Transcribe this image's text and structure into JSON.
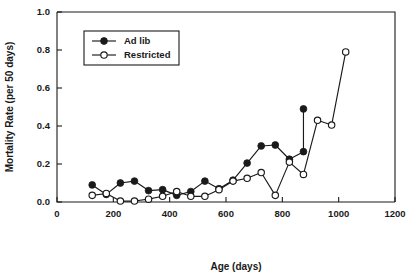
{
  "chart_data": {
    "type": "line",
    "title": "",
    "xlabel": "Age (days)",
    "ylabel": "Mortality Rate (per 50 days)",
    "xlim": [
      0,
      1200
    ],
    "ylim": [
      0.0,
      1.0
    ],
    "xticks": [
      0,
      200,
      400,
      600,
      800,
      1000,
      1200
    ],
    "xtick_labels": [
      "0",
      "200",
      "400",
      "600",
      "800",
      "1000",
      "1200"
    ],
    "yticks": [
      0.0,
      0.2,
      0.4,
      0.6,
      0.8,
      1.0
    ],
    "ytick_labels": [
      "0.0",
      "0.2",
      "0.4",
      "0.6",
      "0.8",
      "1.0"
    ],
    "grid": false,
    "legend_position": "upper-left-inset",
    "series": [
      {
        "name": "Ad lib",
        "marker": "filled-circle",
        "color": "#1a1a1a",
        "x": [
          125,
          175,
          225,
          275,
          325,
          375,
          425,
          475,
          525,
          575,
          625,
          675,
          725,
          775,
          825,
          875,
          875
        ],
        "y": [
          0.09,
          0.04,
          0.1,
          0.11,
          0.06,
          0.065,
          0.035,
          0.055,
          0.11,
          0.07,
          0.115,
          0.205,
          0.295,
          0.3,
          0.225,
          0.265,
          0.49
        ]
      },
      {
        "name": "Restricted",
        "marker": "open-circle",
        "color": "#1a1a1a",
        "x": [
          125,
          175,
          225,
          275,
          325,
          375,
          425,
          475,
          525,
          575,
          625,
          675,
          725,
          775,
          825,
          875,
          925,
          975,
          1025
        ],
        "y": [
          0.035,
          0.045,
          0.005,
          0.005,
          0.015,
          0.03,
          0.055,
          0.03,
          0.03,
          0.065,
          0.11,
          0.125,
          0.155,
          0.035,
          0.21,
          0.145,
          0.43,
          0.405,
          0.79
        ]
      }
    ],
    "legend_entries": [
      {
        "label": "Ad lib",
        "marker": "filled-circle"
      },
      {
        "label": "Restricted",
        "marker": "open-circle"
      }
    ]
  }
}
